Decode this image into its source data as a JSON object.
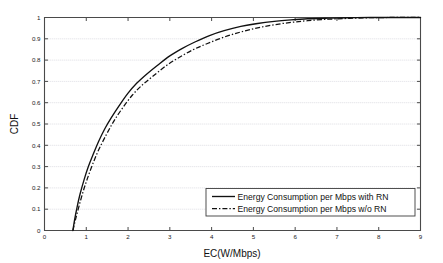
{
  "chart_data": {
    "type": "line",
    "title": "",
    "xlabel": "EC(W/Mbps)",
    "ylabel": "CDF",
    "xlim": [
      0,
      9
    ],
    "ylim": [
      0,
      1
    ],
    "grid": "horizontal-dotted",
    "legend_position": "lower-right",
    "xticks": [
      "0",
      "1",
      "2",
      "3",
      "4",
      "5",
      "6",
      "7",
      "8",
      "9"
    ],
    "xtick_values": [
      0,
      1,
      2,
      3,
      4,
      5,
      6,
      7,
      8,
      9
    ],
    "yticks": [
      "0",
      "0.1",
      "0.2",
      "0.3",
      "0.4",
      "0.5",
      "0.6",
      "0.7",
      "0.8",
      "0.9",
      "1"
    ],
    "ytick_values": [
      0,
      0.1,
      0.2,
      0.3,
      0.4,
      0.5,
      0.6,
      0.7,
      0.8,
      0.9,
      1
    ],
    "series": [
      {
        "name": "Energy Consumption per Mbps with RN",
        "style": "solid",
        "color": "#111111",
        "x": [
          0.68,
          0.72,
          0.78,
          0.85,
          0.95,
          1.05,
          1.15,
          1.3,
          1.45,
          1.6,
          1.8,
          2.0,
          2.2,
          2.45,
          2.7,
          3.0,
          3.3,
          3.6,
          3.95,
          4.3,
          4.7,
          5.1,
          5.5,
          5.9,
          6.3,
          6.8,
          7.3,
          7.8,
          8.2,
          9.0
        ],
        "y": [
          0.0,
          0.05,
          0.11,
          0.17,
          0.24,
          0.3,
          0.35,
          0.42,
          0.48,
          0.53,
          0.59,
          0.645,
          0.69,
          0.735,
          0.775,
          0.82,
          0.855,
          0.885,
          0.915,
          0.938,
          0.958,
          0.972,
          0.982,
          0.989,
          0.994,
          0.997,
          0.999,
          1.0,
          1.0,
          1.0
        ]
      },
      {
        "name": "Energy Consumption per Mbps w/o RN",
        "style": "dash-dot",
        "color": "#111111",
        "x": [
          0.68,
          0.74,
          0.82,
          0.92,
          1.02,
          1.15,
          1.3,
          1.48,
          1.65,
          1.85,
          2.1,
          2.35,
          2.6,
          2.9,
          3.2,
          3.55,
          3.9,
          4.3,
          4.7,
          5.1,
          5.5,
          5.9,
          6.3,
          6.8,
          7.3,
          7.8,
          8.2,
          9.0
        ],
        "y": [
          0.0,
          0.05,
          0.11,
          0.18,
          0.24,
          0.31,
          0.38,
          0.45,
          0.51,
          0.57,
          0.635,
          0.685,
          0.725,
          0.772,
          0.81,
          0.848,
          0.878,
          0.908,
          0.932,
          0.951,
          0.966,
          0.977,
          0.985,
          0.992,
          0.996,
          0.999,
          1.0,
          1.0
        ]
      }
    ],
    "legend_entries": [
      {
        "label": "Energy Consumption per Mbps with RN",
        "style": "solid"
      },
      {
        "label": "Energy Consumption per Mbps w/o RN",
        "style": "dash-dot"
      }
    ]
  }
}
